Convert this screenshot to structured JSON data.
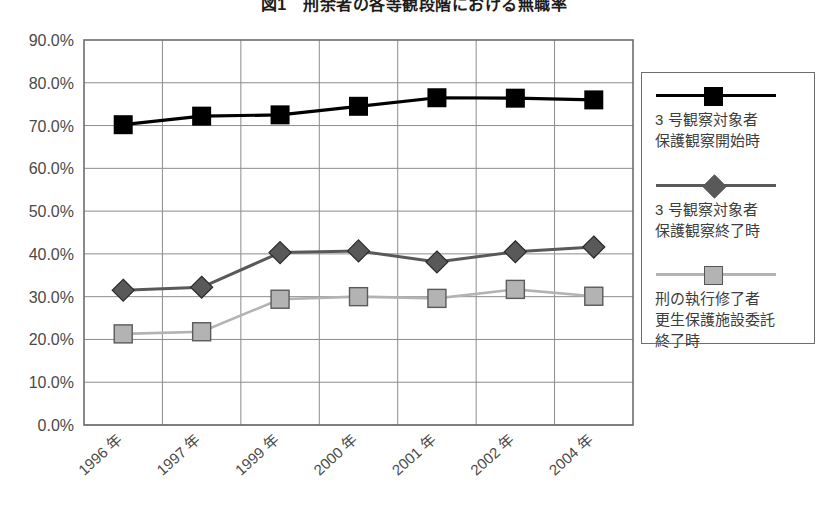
{
  "title": "図1　刑余者の各等観段階における無職率",
  "legend": {
    "entries": [
      {
        "label": "3 号観察対象者\n保護観察開始時",
        "color": "#000000",
        "marker": "square"
      },
      {
        "label": "3 号観察対象者\n保護観察終了時",
        "color": "#595959",
        "marker": "diamond"
      },
      {
        "label": "刑の執行修了者\n更生保護施設委託\n終了時",
        "color": "#b3b3b3",
        "marker": "square"
      }
    ]
  },
  "chart_data": {
    "type": "line",
    "title": "図1　刑余者の各等観段階における無職率",
    "xlabel": "",
    "ylabel": "",
    "categories": [
      "1996 年",
      "1997 年",
      "1999 年",
      "2000 年",
      "2001 年",
      "2002 年",
      "2004 年"
    ],
    "ylim": [
      0,
      90
    ],
    "ytick_labels": [
      "0.0%",
      "10.0%",
      "20.0%",
      "30.0%",
      "40.0%",
      "50.0%",
      "60.0%",
      "70.0%",
      "80.0%",
      "90.0%"
    ],
    "ytick_values": [
      0,
      10,
      20,
      30,
      40,
      50,
      60,
      70,
      80,
      90
    ],
    "grid": true,
    "legend_position": "right",
    "series": [
      {
        "name": "3 号観察対象者\n保護観察開始時",
        "color": "#000000",
        "marker": "square",
        "values": [
          70.2,
          72.2,
          72.5,
          74.5,
          76.5,
          76.4,
          76.0
        ]
      },
      {
        "name": "3 号観察対象者\n保護観察終了時",
        "color": "#595959",
        "marker": "diamond",
        "values": [
          31.5,
          32.2,
          40.3,
          40.7,
          38.1,
          40.5,
          41.6
        ]
      },
      {
        "name": "刑の執行修了者\n更生保護施設委託\n終了時",
        "color": "#b3b3b3",
        "marker": "square",
        "values": [
          21.3,
          21.8,
          29.4,
          30.0,
          29.6,
          31.7,
          30.1
        ]
      }
    ]
  }
}
